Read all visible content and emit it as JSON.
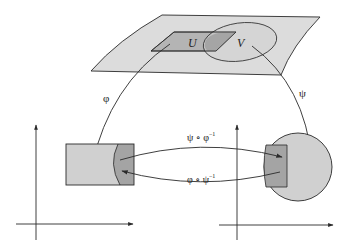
{
  "colors": {
    "stroke": "#2a2a2a",
    "surface_fill": "#dcdcdc",
    "region_fill": "#d2d2d2",
    "overlap_fill": "#a8a8a8",
    "chart_fill": "#d0d0d0",
    "background": "#ffffff"
  },
  "manifold": {
    "label_U": "U",
    "label_V": "V"
  },
  "maps": {
    "phi": "φ",
    "psi": "ψ",
    "psi_phi_inv_base": "ψ ∘ φ",
    "psi_phi_inv_sup": "−1",
    "phi_psi_inv_base": "φ ∘ ψ",
    "phi_psi_inv_sup": "−1"
  },
  "charts": [
    {
      "name": "left-chart",
      "shape": "rectangle",
      "image_of": "U"
    },
    {
      "name": "right-chart",
      "shape": "disk",
      "image_of": "V"
    }
  ]
}
